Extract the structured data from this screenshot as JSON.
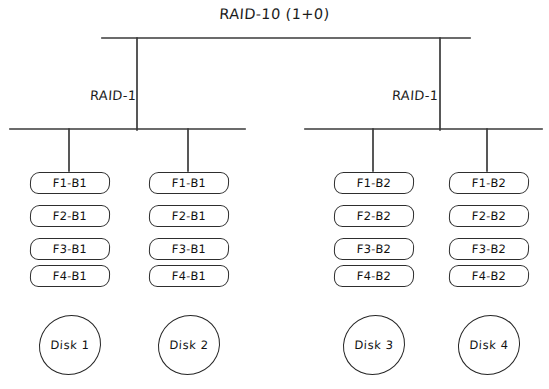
{
  "diagram": {
    "title": "RAID-10 (1+0)",
    "root_label": "RAID-10 (1+0)",
    "mirror_groups": [
      {
        "label": "RAID-1"
      },
      {
        "label": "RAID-1"
      }
    ],
    "columns": [
      {
        "blocks": [
          "F1-B1",
          "F2-B1",
          "F3-B1",
          "F4-B1"
        ],
        "disk": "Disk 1"
      },
      {
        "blocks": [
          "F1-B1",
          "F2-B1",
          "F3-B1",
          "F4-B1"
        ],
        "disk": "Disk 2"
      },
      {
        "blocks": [
          "F1-B2",
          "F2-B2",
          "F3-B2",
          "F4-B2"
        ],
        "disk": "Disk 3"
      },
      {
        "blocks": [
          "F1-B2",
          "F2-B2",
          "F3-B2",
          "F4-B2"
        ],
        "disk": "Disk 4"
      }
    ],
    "colors": {
      "background": "#ffffff",
      "line": "#3a3a3a",
      "block_border": "#2e2e2e",
      "text": "#101010"
    }
  }
}
